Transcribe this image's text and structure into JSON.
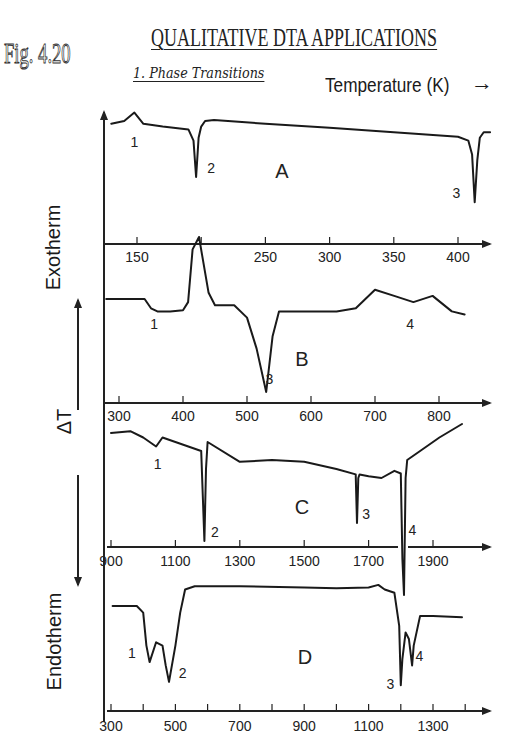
{
  "header": {
    "figure_label": "Fig. 4.20",
    "title": "QUALITATIVE DTA APPLICATIONS",
    "subtitle": "1. Phase Transitions",
    "x_axis_label": "Temperature (K)",
    "x_axis_arrow": "→"
  },
  "y_axis": {
    "label_exo": "Exotherm",
    "label_delta": "ΔT",
    "label_endo": "Endotherm"
  },
  "chart_data": [
    {
      "type": "line",
      "panel": "A",
      "xlabel": "Temperature (K)",
      "ylabel": "ΔT",
      "xlim": [
        125,
        425
      ],
      "x_ticks": [
        150,
        200,
        250,
        300,
        350,
        400
      ],
      "x_tick_labels": [
        "150",
        "",
        "250",
        "300",
        "350",
        "400"
      ],
      "grid": false,
      "series": [
        {
          "name": "A",
          "x": [
            130,
            140,
            148,
            155,
            170,
            190,
            194,
            196,
            198,
            200,
            203,
            210,
            250,
            300,
            350,
            400,
            408,
            411,
            413,
            415,
            417,
            420,
            425
          ],
          "y": [
            -0.05,
            0.0,
            0.15,
            -0.05,
            -0.1,
            -0.15,
            -0.35,
            -1.0,
            -0.3,
            -0.1,
            0.0,
            0.02,
            -0.05,
            -0.12,
            -0.2,
            -0.28,
            -0.35,
            -0.6,
            -1.45,
            -0.7,
            -0.3,
            -0.2,
            -0.2
          ]
        }
      ],
      "annotations": [
        {
          "text": "1",
          "x": 148
        },
        {
          "text": "2",
          "x": 203
        },
        {
          "text": "3",
          "x": 405
        }
      ]
    },
    {
      "type": "line",
      "panel": "B",
      "xlabel": "Temperature (K)",
      "ylabel": "ΔT",
      "xlim": [
        275,
        875
      ],
      "x_ticks": [
        300,
        400,
        500,
        600,
        700,
        800
      ],
      "x_tick_labels": [
        "300",
        "400",
        "500",
        "600",
        "700",
        "800"
      ],
      "grid": false,
      "series": [
        {
          "name": "B",
          "x": [
            280,
            340,
            350,
            360,
            380,
            400,
            408,
            415,
            425,
            430,
            440,
            450,
            480,
            500,
            515,
            530,
            540,
            550,
            560,
            640,
            670,
            700,
            730,
            760,
            790,
            820,
            840
          ],
          "y": [
            0.0,
            0.0,
            -0.15,
            -0.2,
            -0.2,
            -0.18,
            -0.05,
            0.8,
            1.0,
            0.7,
            0.1,
            -0.1,
            -0.1,
            -0.3,
            -0.8,
            -1.5,
            -0.6,
            -0.2,
            -0.2,
            -0.2,
            -0.15,
            0.15,
            0.05,
            -0.05,
            0.05,
            -0.2,
            -0.25
          ]
        }
      ],
      "annotations": [
        {
          "text": "1",
          "x": 355
        },
        {
          "text": "3",
          "x": 535
        },
        {
          "text": "4",
          "x": 755
        }
      ]
    },
    {
      "type": "line",
      "panel": "C",
      "xlabel": "Temperature (K)",
      "ylabel": "ΔT",
      "xlim": [
        900,
        2050
      ],
      "x_ticks": [
        900,
        1100,
        1300,
        1500,
        1700,
        1900
      ],
      "x_tick_labels": [
        "900",
        "1100",
        "1300",
        "1500",
        "1700",
        "1900"
      ],
      "axis_break": [
        1790,
        1830
      ],
      "grid": false,
      "series": [
        {
          "name": "C",
          "x": [
            900,
            960,
            1000,
            1040,
            1060,
            1100,
            1180,
            1185,
            1190,
            1195,
            1200,
            1300,
            1400,
            1500,
            1600,
            1660,
            1664,
            1668,
            1672,
            1700,
            1740,
            1780,
            1800,
            1805,
            1810,
            1815,
            1820,
            1860,
            1920,
            1990
          ],
          "y": [
            0.1,
            0.12,
            0.05,
            -0.05,
            0.05,
            0.0,
            -0.1,
            -0.6,
            -1.1,
            -0.3,
            0.0,
            -0.22,
            -0.2,
            -0.22,
            -0.3,
            -0.36,
            -0.9,
            -0.4,
            -0.36,
            -0.38,
            -0.4,
            -0.32,
            -0.35,
            -1.3,
            -1.7,
            -0.4,
            -0.2,
            -0.1,
            0.05,
            0.2
          ]
        }
      ],
      "annotations": [
        {
          "text": "1",
          "x": 1045
        },
        {
          "text": "2",
          "x": 1210
        },
        {
          "text": "3",
          "x": 1680
        },
        {
          "text": "4",
          "x": 1830
        }
      ]
    },
    {
      "type": "line",
      "panel": "D",
      "xlabel": "Temperature (K)",
      "ylabel": "ΔT",
      "xlim": [
        300,
        1400
      ],
      "x_ticks": [
        300,
        400,
        500,
        600,
        700,
        800,
        900,
        1000,
        1100,
        1200,
        1300,
        1400
      ],
      "x_tick_labels": [
        "300",
        "",
        "500",
        "",
        "700",
        "",
        "900",
        "",
        "1100",
        "",
        "1300",
        ""
      ],
      "grid": false,
      "series": [
        {
          "name": "D",
          "x": [
            305,
            380,
            400,
            410,
            420,
            440,
            460,
            470,
            480,
            500,
            515,
            530,
            560,
            700,
            900,
            1000,
            1100,
            1130,
            1150,
            1180,
            1195,
            1200,
            1205,
            1215,
            1225,
            1235,
            1240,
            1260,
            1300,
            1390
          ],
          "y": [
            0.0,
            0.0,
            -0.1,
            -0.6,
            -0.85,
            -0.55,
            -0.6,
            -0.9,
            -1.15,
            -0.6,
            -0.1,
            0.25,
            0.3,
            0.3,
            0.28,
            0.27,
            0.28,
            0.32,
            0.25,
            0.2,
            -0.3,
            -1.2,
            -0.8,
            -0.4,
            -0.5,
            -0.9,
            -0.6,
            -0.15,
            -0.15,
            -0.17
          ]
        }
      ],
      "annotations": [
        {
          "text": "1",
          "x": 390
        },
        {
          "text": "2",
          "x": 510
        },
        {
          "text": "3",
          "x": 1180
        },
        {
          "text": "4",
          "x": 1245
        }
      ]
    }
  ]
}
